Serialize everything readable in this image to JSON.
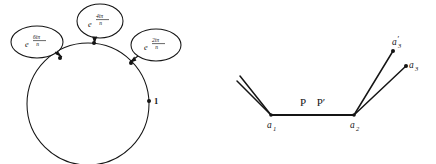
{
  "figure": {
    "background_color": "#ffffff",
    "ink_color": "#151515",
    "width": 436,
    "height": 164
  },
  "left_figure": {
    "name": "roots-of-unity-circle",
    "circle": {
      "center_x": 88,
      "center_y": 104,
      "radius": 61
    },
    "point_one": {
      "label": "1",
      "x": 149,
      "y": 101
    },
    "callouts": [
      {
        "id": "callout-6ipi-n",
        "base": "e",
        "numerator": "6iπ",
        "denominator": "n",
        "full_text": "e^(6iπ/n)",
        "ellipse_cx": 37,
        "ellipse_cy": 42,
        "ellipse_rx": 26,
        "ellipse_ry": 16,
        "target_x": 60,
        "target_y": 58
      },
      {
        "id": "callout-4ipi-n",
        "base": "e",
        "numerator": "4iπ",
        "denominator": "n",
        "full_text": "e^(4iπ/n)",
        "ellipse_cx": 100,
        "ellipse_cy": 21,
        "ellipse_rx": 23,
        "ellipse_ry": 17,
        "target_x": 94,
        "target_y": 43
      },
      {
        "id": "callout-2ipi-n",
        "base": "e",
        "numerator": "2iπ",
        "denominator": "n",
        "full_text": "e^(2iπ/n)",
        "ellipse_cx": 156,
        "ellipse_cy": 45,
        "ellipse_rx": 25,
        "ellipse_ry": 16,
        "target_x": 131,
        "target_y": 63
      }
    ]
  },
  "right_figure": {
    "name": "path-branch-diagram",
    "vertices": [
      {
        "id": "a1",
        "label": "a",
        "subscript": "1",
        "prime": "",
        "x": 53,
        "y": 115
      },
      {
        "id": "a2",
        "label": "a",
        "subscript": "2",
        "prime": "",
        "x": 136,
        "y": 115
      },
      {
        "id": "a3prime",
        "label": "a",
        "subscript": "3",
        "prime": "′",
        "x": 179,
        "y": 48
      },
      {
        "id": "a3",
        "label": "a",
        "subscript": "3",
        "prime": "",
        "x": 192,
        "y": 63
      }
    ],
    "segment_labels": [
      {
        "id": "label-P",
        "text": "P",
        "x": 85,
        "y": 104
      },
      {
        "id": "label-P-prime",
        "text": "P′",
        "x": 101,
        "y": 104
      }
    ],
    "incoming_tails": [
      {
        "id": "tail-upper",
        "from_x": 22,
        "from_y": 76,
        "to_x": 53,
        "to_y": 115
      },
      {
        "id": "tail-lower",
        "from_x": 19,
        "from_y": 81,
        "to_x": 53,
        "to_y": 115
      }
    ],
    "outgoing_branches": [
      {
        "id": "branch-a3prime",
        "from_x": 136,
        "from_y": 115,
        "to_x": 175,
        "to_y": 51
      },
      {
        "id": "branch-a3",
        "from_x": 136,
        "from_y": 115,
        "to_x": 188,
        "to_y": 66
      }
    ],
    "shared_segment": {
      "id": "segment-a1-a2",
      "from_x": 53,
      "from_y": 115,
      "to_x": 136,
      "to_y": 115
    }
  }
}
